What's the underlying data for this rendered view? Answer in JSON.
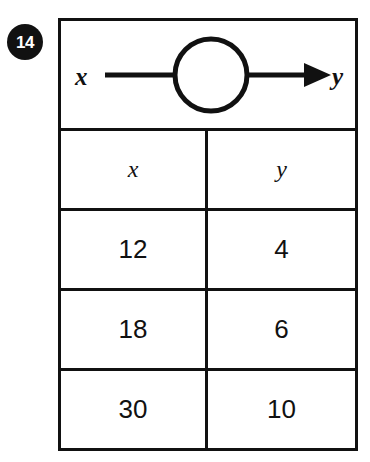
{
  "question": {
    "number": "14"
  },
  "diagram": {
    "input_label": "x",
    "output_label": "y",
    "machine_shape": "circle",
    "arrow_direction": "right",
    "stroke_color": "#111111"
  },
  "table": {
    "headers": [
      "x",
      "y"
    ],
    "rows": [
      {
        "x": "12",
        "y": "4"
      },
      {
        "x": "18",
        "y": "6"
      },
      {
        "x": "30",
        "y": "10"
      }
    ]
  },
  "colors": {
    "ink": "#111111",
    "paper": "#ffffff",
    "badge_background": "#111111",
    "badge_text": "#ffffff"
  }
}
